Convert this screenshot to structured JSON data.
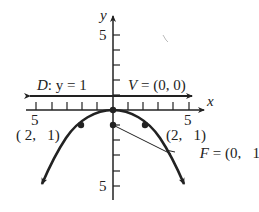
{
  "figure": {
    "type": "parabola",
    "equation_implied": "x^2 = -4y",
    "axes": {
      "x_label": "x",
      "y_label": "y",
      "x_tick_label_left": "5",
      "x_tick_label_right": "5",
      "y_tick_label_top": "5",
      "y_tick_label_bottom": "5",
      "x_range": [
        -5,
        5
      ],
      "y_range": [
        -5,
        5
      ],
      "tick_step": 1
    },
    "directrix": {
      "label_name": "D",
      "label_eq": ": y = 1",
      "y": 1
    },
    "vertex": {
      "label_name": "V",
      "label_eq": " = (0, 0)",
      "x": 0,
      "y": 0
    },
    "focus": {
      "label_name": "F",
      "label_eq": " = (0,   1)",
      "x": 0,
      "y": -1
    },
    "points": [
      {
        "label": "( 2,   1)",
        "x": -2,
        "y": -1
      },
      {
        "label": "(2,   1)",
        "x": 2,
        "y": -1
      }
    ],
    "colors": {
      "ink": "#222222",
      "background": "#ffffff"
    }
  }
}
